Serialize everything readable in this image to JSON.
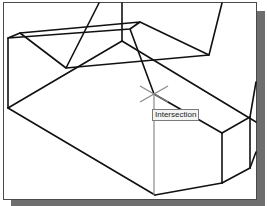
{
  "snap_tooltip": {
    "label": "Intersection"
  },
  "colors": {
    "background": "#ffffff",
    "line": "#111111",
    "crosshair": "#8a8a8a",
    "shadow": "#6e6e6e",
    "frame_border": "#4a4a4a"
  },
  "cursor": {
    "type": "crosshair",
    "x": 154,
    "y": 94,
    "snap_mode": "Intersection"
  }
}
